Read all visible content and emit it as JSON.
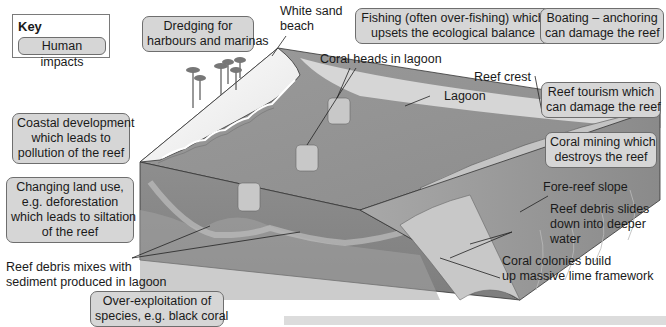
{
  "key": {
    "title": "Key",
    "swatch_label": "Human impacts"
  },
  "human_impacts": [
    {
      "id": "dredging",
      "lines": [
        "Dredging for",
        "harbours and marinas"
      ]
    },
    {
      "id": "fishing",
      "lines": [
        "Fishing (often over-fishing) which",
        "upsets the ecological balance"
      ]
    },
    {
      "id": "boating",
      "lines": [
        "Boating – anchoring",
        "can damage the reef"
      ]
    },
    {
      "id": "coastal",
      "lines": [
        "Coastal development",
        "which leads to",
        "pollution of the reef"
      ]
    },
    {
      "id": "land-use",
      "lines": [
        "Changing land use,",
        "e.g. deforestation",
        "which leads to siltation",
        "of the reef"
      ]
    },
    {
      "id": "tourism",
      "lines": [
        "Reef tourism which",
        "can damage the reef"
      ]
    },
    {
      "id": "mining",
      "lines": [
        "Coral mining which",
        "destroys the reef"
      ]
    },
    {
      "id": "over-exploitation",
      "lines": [
        "Over-exploitation of",
        "species, e.g. black coral"
      ]
    }
  ],
  "features": [
    {
      "id": "white-sand-beach",
      "lines": [
        "White sand",
        "beach"
      ]
    },
    {
      "id": "coral-heads",
      "lines": [
        "Coral heads in lagoon"
      ]
    },
    {
      "id": "reef-crest",
      "lines": [
        "Reef crest"
      ]
    },
    {
      "id": "lagoon",
      "lines": [
        "Lagoon"
      ]
    },
    {
      "id": "fore-reef-slope",
      "lines": [
        "Fore-reef slope"
      ]
    },
    {
      "id": "reef-debris-slides",
      "lines": [
        "Reef debris slides",
        "down into deeper",
        "water"
      ]
    },
    {
      "id": "coral-colonies",
      "lines": [
        "Coral colonies build",
        "up massive lime framework"
      ]
    },
    {
      "id": "reef-debris-mixes",
      "lines": [
        "Reef debris mixes with",
        "sediment produced in lagoon"
      ]
    }
  ],
  "colors": {
    "impact_box_fill": "#d6d6d6",
    "impact_box_border": "#6e6e6e",
    "sea_dark": "#8a8a8a",
    "sea_mid": "#a3a3a3",
    "lagoon": "#d4d4d4",
    "sand": "#f2f2f2",
    "reef": "#c2c2c2"
  }
}
